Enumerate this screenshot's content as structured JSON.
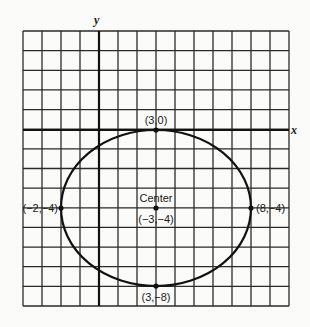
{
  "diagram": {
    "type": "ellipse-on-grid",
    "grid": {
      "columns": 14,
      "rows": 14,
      "line_color": "#2a2a2a",
      "background": "#fbfbfa"
    },
    "axes": {
      "x_label": "x",
      "y_label": "y"
    },
    "ellipse": {
      "center": [
        3,
        -4
      ],
      "semi_axis_x": 5,
      "semi_axis_y": 4,
      "stroke": "#111111"
    },
    "points": [
      {
        "id": "top",
        "label": "(3,0)",
        "coord": [
          3,
          0
        ]
      },
      {
        "id": "left",
        "label": "(−2,−4)",
        "coord": [
          -2,
          -4
        ]
      },
      {
        "id": "right",
        "label": "(8,−4)",
        "coord": [
          8,
          -4
        ]
      },
      {
        "id": "bottom",
        "label": "(3,−8)",
        "coord": [
          3,
          -8
        ]
      },
      {
        "id": "center",
        "label": "(−3,−4)",
        "coord": [
          3,
          -4
        ]
      }
    ],
    "center_title": "Center"
  }
}
